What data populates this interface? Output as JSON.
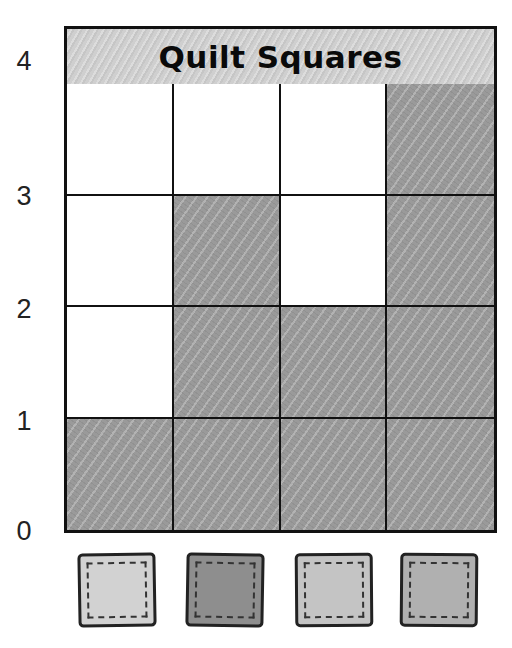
{
  "title": "Quilt Squares",
  "y_axis": {
    "ticks": [
      "0",
      "1",
      "2",
      "3",
      "4"
    ]
  },
  "columns": [
    {
      "id": "1",
      "swatch_color": "#d2d2d2",
      "value": 1
    },
    {
      "id": "2",
      "swatch_color": "#8e8e8e",
      "value": 3
    },
    {
      "id": "3",
      "swatch_color": "#c4c4c4",
      "value": 2
    },
    {
      "id": "4",
      "swatch_color": "#b0b0b0",
      "value": 4
    }
  ],
  "colors": {
    "fill": "#9a9a9a",
    "grid_line": "#111111",
    "title_bg": "#d0d0d0"
  },
  "chart_data": {
    "type": "bar",
    "title": "Quilt Squares",
    "categories": [
      "light gray quilt square",
      "dark gray quilt square",
      "light gray quilt square",
      "medium gray quilt square"
    ],
    "values": [
      1,
      3,
      2,
      4
    ],
    "xlabel": "",
    "ylabel": "",
    "ylim": [
      0,
      4
    ],
    "yticks": [
      0,
      1,
      2,
      3,
      4
    ],
    "grid": true,
    "legend": "picture symbols below each column"
  }
}
